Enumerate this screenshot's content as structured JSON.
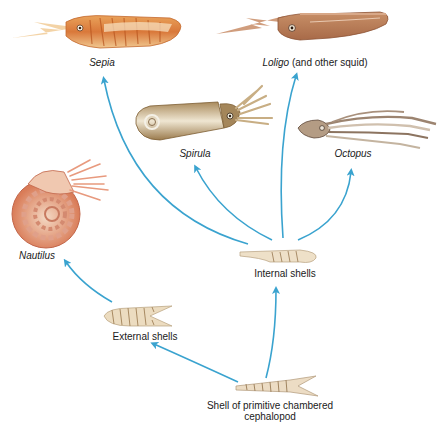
{
  "diagram": {
    "type": "evolutionary-tree",
    "arrow_color": "#3aa3cf",
    "nodes": {
      "root": {
        "label": "Shell of primitive chambered cephalopod",
        "label_line1": "Shell of primitive chambered",
        "label_line2": "cephalopod"
      },
      "external": {
        "label": "External shells"
      },
      "internal": {
        "label": "Internal shells"
      },
      "nautilus": {
        "label": "Nautilus"
      },
      "sepia": {
        "label": "Sepia"
      },
      "loligo": {
        "label_genus": "Loligo",
        "label_suffix": " (and other squid)"
      },
      "spirula": {
        "label": "Spirula"
      },
      "octopus": {
        "label": "Octopus"
      }
    },
    "edges": [
      {
        "from": "Shell of primitive chambered cephalopod",
        "to": "External shells"
      },
      {
        "from": "Shell of primitive chambered cephalopod",
        "to": "Internal shells"
      },
      {
        "from": "External shells",
        "to": "Nautilus"
      },
      {
        "from": "Internal shells",
        "to": "Sepia"
      },
      {
        "from": "Internal shells",
        "to": "Loligo (and other squid)"
      },
      {
        "from": "Internal shells",
        "to": "Spirula"
      },
      {
        "from": "Internal shells",
        "to": "Octopus"
      }
    ]
  }
}
